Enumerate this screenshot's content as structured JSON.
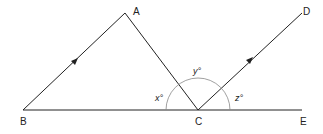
{
  "diagram": {
    "points": {
      "A": {
        "label": "A",
        "x": 125,
        "y": 13
      },
      "B": {
        "label": "B",
        "x": 23,
        "y": 110
      },
      "C": {
        "label": "C",
        "x": 198,
        "y": 110
      },
      "D": {
        "label": "D",
        "x": 302,
        "y": 13
      },
      "E": {
        "label": "E",
        "x": 302,
        "y": 110
      }
    },
    "angles": {
      "x": "x°",
      "y": "y°",
      "z": "z°"
    },
    "colors": {
      "line": "#222222",
      "arc": "#888888"
    }
  }
}
